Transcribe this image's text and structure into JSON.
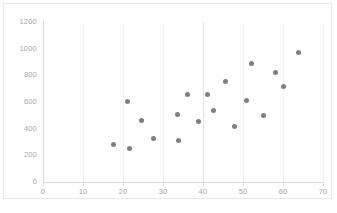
{
  "chart_data": {
    "type": "scatter",
    "title": "",
    "xlabel": "",
    "ylabel": "",
    "xlim": [
      0,
      70
    ],
    "ylim": [
      0,
      1200
    ],
    "xticks": [
      0,
      10,
      20,
      30,
      40,
      50,
      60,
      70
    ],
    "yticks": [
      0,
      200,
      400,
      600,
      800,
      1000,
      1200
    ],
    "grid": true,
    "legend": false,
    "marker_color": "#7f7f7f",
    "marker_shape": "circle",
    "series": [
      {
        "name": "Series 1",
        "points": [
          {
            "x": 17.5,
            "y": 285
          },
          {
            "x": 21.0,
            "y": 605
          },
          {
            "x": 21.5,
            "y": 255
          },
          {
            "x": 24.5,
            "y": 460
          },
          {
            "x": 27.5,
            "y": 325
          },
          {
            "x": 33.5,
            "y": 505
          },
          {
            "x": 33.8,
            "y": 315
          },
          {
            "x": 36.0,
            "y": 660
          },
          {
            "x": 38.8,
            "y": 455
          },
          {
            "x": 41.0,
            "y": 655
          },
          {
            "x": 42.5,
            "y": 535
          },
          {
            "x": 45.5,
            "y": 755
          },
          {
            "x": 47.8,
            "y": 415
          },
          {
            "x": 50.8,
            "y": 615
          },
          {
            "x": 52.0,
            "y": 890
          },
          {
            "x": 55.0,
            "y": 500
          },
          {
            "x": 58.0,
            "y": 820
          },
          {
            "x": 60.0,
            "y": 720
          },
          {
            "x": 63.8,
            "y": 970
          }
        ]
      }
    ]
  }
}
